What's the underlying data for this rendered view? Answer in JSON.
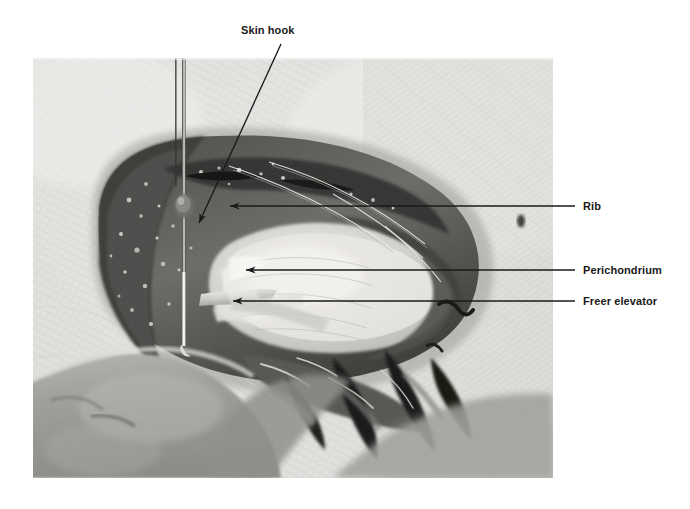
{
  "figure": {
    "kind": "clinical-surgical-photograph",
    "background_color": "#ffffff",
    "photo": {
      "x": 33,
      "y": 58,
      "width": 520,
      "height": 420,
      "tone": "grayscale"
    }
  },
  "annotations": [
    {
      "id": "skin-hook",
      "label": "Skin hook",
      "label_x": 241,
      "label_y": 24,
      "leader": {
        "x1": 281,
        "y1": 44,
        "x2": 198,
        "y2": 224
      },
      "arrow": "down-left",
      "color": "#1a1a1a"
    },
    {
      "id": "rib",
      "label": "Rib",
      "label_x": 583,
      "label_y": 200,
      "leader": {
        "x1": 575,
        "y1": 206,
        "x2": 229,
        "y2": 206
      },
      "arrow": "left",
      "color": "#1a1a1a"
    },
    {
      "id": "perichondrium",
      "label": "Perichondrium",
      "label_x": 583,
      "label_y": 264,
      "leader": {
        "x1": 575,
        "y1": 270,
        "x2": 245,
        "y2": 270
      },
      "arrow": "left",
      "color": "#1a1a1a"
    },
    {
      "id": "freer-elevator",
      "label": "Freer elevator",
      "label_x": 583,
      "label_y": 295,
      "leader": {
        "x1": 575,
        "y1": 301,
        "x2": 232,
        "y2": 301
      },
      "arrow": "left",
      "color": "#1a1a1a"
    }
  ],
  "colors": {
    "ink": "#1a1a1a",
    "page": "#ffffff"
  }
}
